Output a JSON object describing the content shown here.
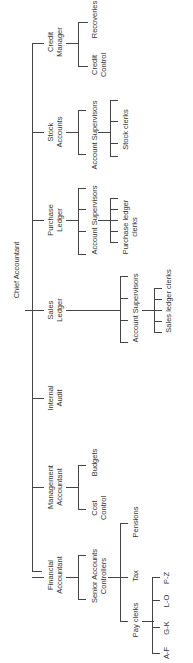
{
  "root": "Chief Accountant",
  "departments": [
    {
      "name_l1": "Credit",
      "name_l2": "Manager",
      "children": [
        {
          "l1": "Recoveries",
          "l2": ""
        },
        {
          "l1": "Credit",
          "l2": "Control"
        }
      ]
    },
    {
      "name_l1": "Stock",
      "name_l2": "Accounts",
      "children": [
        {
          "l1": "Account Supervisors",
          "l2": ""
        }
      ],
      "grandchildren": [
        {
          "l1": "Stock clerks"
        }
      ]
    },
    {
      "name_l1": "Purchase",
      "name_l2": "Ledger",
      "children": [
        {
          "l1": "Account Supervisors",
          "l2": ""
        }
      ],
      "grandchildren": [
        {
          "l1": "Purchase ledger",
          "l2": "clerks"
        }
      ]
    },
    {
      "name_l1": "Sales",
      "name_l2": "Ledger",
      "children": [
        {
          "l1": "Account Supervisors",
          "l2": ""
        }
      ],
      "grandchildren": [
        {
          "l1": "Sales ledger clerks"
        }
      ]
    },
    {
      "name_l1": "Internal",
      "name_l2": "Audit",
      "children": []
    },
    {
      "name_l1": "Management",
      "name_l2": "Accountant",
      "children": [
        {
          "l1": "Budgets",
          "l2": ""
        },
        {
          "l1": "Cost",
          "l2": "Control"
        }
      ]
    },
    {
      "name_l1": "Financial",
      "name_l2": "Accountant",
      "children": [
        {
          "l1": "Senior Accounts",
          "l2": "Controllers"
        }
      ],
      "sub": [
        {
          "l1": "Pensions"
        },
        {
          "l1": "Tax"
        },
        {
          "l1": "Pay clerks"
        }
      ],
      "pay_groups": [
        "P-Z",
        "L-O",
        "G-K",
        "A-F"
      ]
    }
  ]
}
